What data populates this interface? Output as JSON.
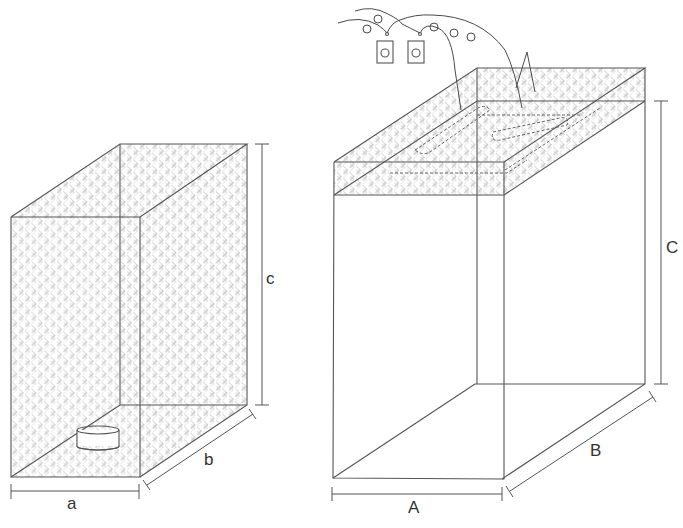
{
  "figure": {
    "left_enclosure": {
      "dimension_labels": {
        "width": "a",
        "depth": "b",
        "height": "c"
      },
      "contents": "cylindrical-dish",
      "surface": "mesh"
    },
    "right_enclosure": {
      "dimension_labels": {
        "width": "A",
        "depth": "B",
        "height": "C"
      },
      "top_band": "mesh",
      "devices": [
        {
          "name": "device-1"
        },
        {
          "name": "device-2"
        }
      ]
    },
    "colors": {
      "line": "#555555",
      "mesh": "#9a9a9a",
      "background": "#ffffff"
    }
  }
}
